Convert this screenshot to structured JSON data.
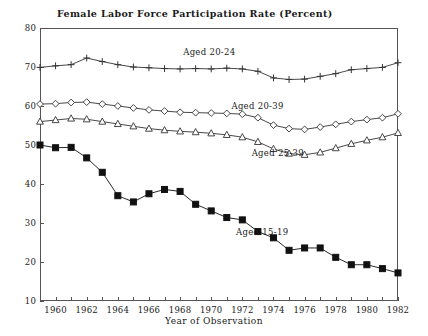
{
  "chart_data": {
    "type": "line",
    "title": "Female Labor Force Participation Rate (Percent)",
    "xlabel": "Year of Observation",
    "ylabel": "",
    "xlim": [
      1959,
      1982
    ],
    "ylim": [
      10,
      80
    ],
    "ytick_values": [
      10,
      20,
      30,
      40,
      50,
      60,
      70,
      80
    ],
    "ytick_labels": [
      "10",
      "20",
      "30",
      "40",
      "50",
      "60",
      "70",
      "80"
    ],
    "xtick_values": [
      1959,
      1960,
      1961,
      1962,
      1963,
      1964,
      1965,
      1966,
      1967,
      1968,
      1969,
      1970,
      1971,
      1972,
      1973,
      1974,
      1975,
      1976,
      1977,
      1978,
      1979,
      1980,
      1981,
      1982
    ],
    "xtick_labels_shown": [
      "1960",
      "1962",
      "1964",
      "1966",
      "1968",
      "1970",
      "1972",
      "1974",
      "1976",
      "1978",
      "1980",
      "1982"
    ],
    "xtick_labels_values": [
      1960,
      1962,
      1964,
      1966,
      1968,
      1970,
      1972,
      1974,
      1976,
      1978,
      1980,
      1982
    ],
    "grid": false,
    "legend_position": "inline-annotations",
    "x": [
      1959,
      1960,
      1961,
      1962,
      1963,
      1964,
      1965,
      1966,
      1967,
      1968,
      1969,
      1970,
      1971,
      1972,
      1973,
      1974,
      1975,
      1976,
      1977,
      1978,
      1979,
      1980,
      1981,
      1982
    ],
    "series": [
      {
        "name": "Aged 20-24",
        "marker": "plus",
        "label": "Aged 20-24",
        "label_x": 1968.2,
        "label_y": 73.5,
        "color": "#333333",
        "values": [
          69.9,
          70.3,
          70.6,
          72.3,
          71.4,
          70.6,
          70.0,
          69.8,
          69.6,
          69.5,
          69.6,
          69.5,
          69.7,
          69.5,
          68.9,
          67.2,
          66.8,
          66.9,
          67.6,
          68.3,
          69.3,
          69.6,
          69.9,
          71.1
        ]
      },
      {
        "name": "Aged 20-39",
        "marker": "diamond",
        "label": "Aged 20-39",
        "label_x": 1971.3,
        "label_y": 59.8,
        "color": "#333333",
        "values": [
          60.5,
          60.6,
          60.9,
          61.0,
          60.5,
          60.0,
          59.5,
          59.0,
          58.7,
          58.4,
          58.3,
          58.2,
          58.1,
          57.9,
          57.0,
          55.1,
          54.2,
          54.0,
          54.6,
          55.3,
          56.0,
          56.5,
          57.0,
          58.0
        ]
      },
      {
        "name": "Aged 25-39",
        "marker": "triangle",
        "label": "Aged 25-39",
        "label_x": 1972.6,
        "label_y": 47.6,
        "color": "#333333",
        "values": [
          56.0,
          56.4,
          56.8,
          56.6,
          56.0,
          55.4,
          54.8,
          54.2,
          53.8,
          53.5,
          53.3,
          53.0,
          52.6,
          52.0,
          50.8,
          49.0,
          47.8,
          47.5,
          48.1,
          49.2,
          50.3,
          51.2,
          52.0,
          53.1
        ]
      },
      {
        "name": "Aged 15-19",
        "marker": "filled-square",
        "label": "Aged 15-19",
        "label_x": 1971.6,
        "label_y": 27.5,
        "color": "#111111",
        "values": [
          50.0,
          49.3,
          49.4,
          46.7,
          43.0,
          37.0,
          35.4,
          37.5,
          38.6,
          38.1,
          34.8,
          33.1,
          31.4,
          30.8,
          27.8,
          26.2,
          23.0,
          23.6,
          23.6,
          21.2,
          19.3,
          19.3,
          18.3,
          17.2
        ]
      }
    ]
  }
}
